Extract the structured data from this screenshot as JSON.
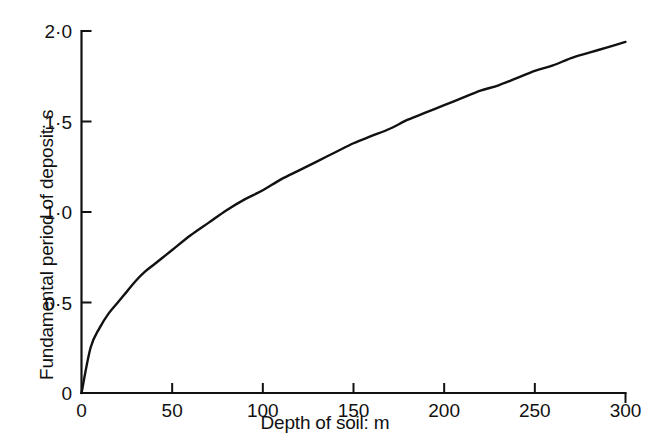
{
  "chart_data": {
    "type": "line",
    "title": "",
    "xlabel": "Depth of soil: m",
    "ylabel": "Fundamental period of deposit: s",
    "xlim": [
      0,
      300
    ],
    "ylim": [
      0,
      2.0
    ],
    "grid": false,
    "legend": null,
    "x_ticks": [
      {
        "value": 0,
        "label": "0"
      },
      {
        "value": 50,
        "label": "50"
      },
      {
        "value": 100,
        "label": "100"
      },
      {
        "value": 150,
        "label": "150"
      },
      {
        "value": 200,
        "label": "200"
      },
      {
        "value": 250,
        "label": "250"
      },
      {
        "value": 300,
        "label": "300"
      }
    ],
    "y_ticks": [
      {
        "value": 0,
        "label": "0"
      },
      {
        "value": 0.5,
        "label": "0·5"
      },
      {
        "value": 1.0,
        "label": "1·0"
      },
      {
        "value": 1.5,
        "label": "1·5"
      },
      {
        "value": 2.0,
        "label": "2·0"
      }
    ],
    "series": [
      {
        "name": "Fundamental period of deposit",
        "color": "#111111",
        "x": [
          0,
          5,
          10,
          15,
          20,
          25,
          30,
          35,
          40,
          45,
          50,
          60,
          70,
          80,
          90,
          100,
          110,
          120,
          130,
          140,
          150,
          160,
          170,
          180,
          190,
          200,
          210,
          220,
          230,
          240,
          250,
          260,
          270,
          280,
          290,
          300
        ],
        "y": [
          0,
          0.25,
          0.36,
          0.44,
          0.5,
          0.56,
          0.62,
          0.67,
          0.71,
          0.75,
          0.79,
          0.87,
          0.94,
          1.01,
          1.07,
          1.12,
          1.18,
          1.23,
          1.28,
          1.33,
          1.38,
          1.42,
          1.46,
          1.51,
          1.55,
          1.59,
          1.63,
          1.67,
          1.7,
          1.74,
          1.78,
          1.81,
          1.85,
          1.88,
          1.91,
          1.94
        ]
      }
    ]
  },
  "axes": {
    "y_axis_name": "y-axis",
    "x_axis_name": "x-axis"
  }
}
